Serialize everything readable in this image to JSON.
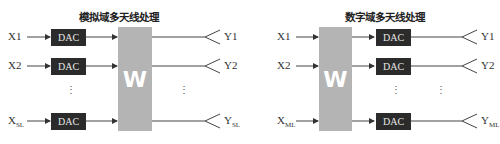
{
  "panels": [
    {
      "title": "模拟域多天线处理",
      "inputs": [
        {
          "label": "X1",
          "sub": ""
        },
        {
          "label": "X2",
          "sub": ""
        },
        {
          "label": "X",
          "sub": "SL"
        }
      ],
      "dac_label": "DAC",
      "matrix_label": "W",
      "outputs": [
        {
          "label": "Y1",
          "sub": ""
        },
        {
          "label": "Y2",
          "sub": ""
        },
        {
          "label": "Y",
          "sub": "SL"
        }
      ],
      "ellipsis": "⋮"
    },
    {
      "title": "数字域多天线处理",
      "inputs": [
        {
          "label": "X1",
          "sub": ""
        },
        {
          "label": "X2",
          "sub": ""
        },
        {
          "label": "X",
          "sub": "ML"
        }
      ],
      "dac_label": "DAC",
      "matrix_label": "W",
      "outputs": [
        {
          "label": "Y1",
          "sub": ""
        },
        {
          "label": "Y2",
          "sub": ""
        },
        {
          "label": "Y",
          "sub": "ML"
        }
      ],
      "ellipsis": "⋮"
    }
  ]
}
